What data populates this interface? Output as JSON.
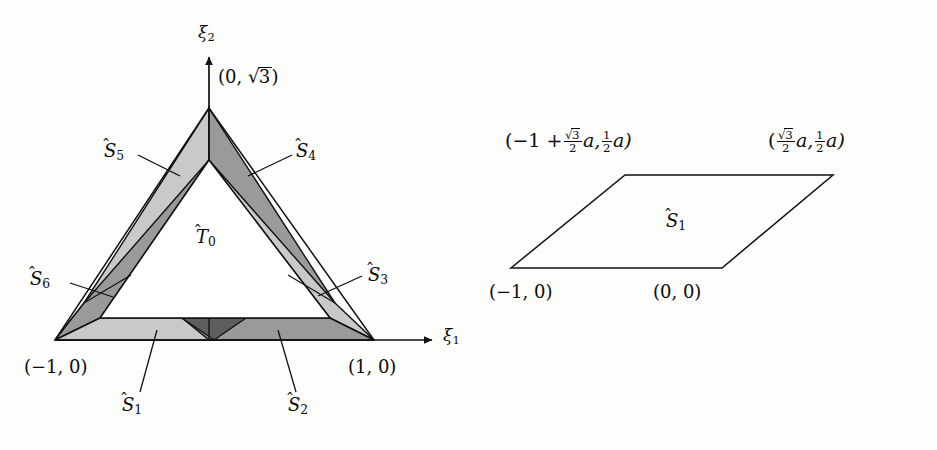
{
  "figure": {
    "colors": {
      "background": "#fdfdfb",
      "stroke": "#111111",
      "light_gray": "#c8c8c8",
      "medium_gray": "#9a9a9a",
      "dark_gray": "#5e5e5e",
      "white": "#ffffff"
    }
  },
  "left_panel": {
    "name": "triangle-with-strips",
    "axes": {
      "x_axis_label": "ξ",
      "x_axis_sub": "1",
      "y_axis_label": "ξ",
      "y_axis_sub": "2"
    },
    "vertices": [
      {
        "name": "apex",
        "label_main": "(0, ",
        "label_sqrt": "3",
        "label_tail": ")",
        "coords": "(0, √3)"
      },
      {
        "name": "bottom-left",
        "label": "(−1, 0)",
        "coords": "(-1,0)"
      },
      {
        "name": "bottom-right",
        "label": "(1, 0)",
        "coords": "(1,0)"
      }
    ],
    "regions": [
      {
        "id": "T0",
        "letter": "T",
        "sub": "0",
        "shade": "white"
      },
      {
        "id": "S1",
        "letter": "S",
        "sub": "1",
        "shade": "light_gray"
      },
      {
        "id": "S2",
        "letter": "S",
        "sub": "2",
        "shade": "medium_gray"
      },
      {
        "id": "S3",
        "letter": "S",
        "sub": "3",
        "shade": "light_gray"
      },
      {
        "id": "S4",
        "letter": "S",
        "sub": "4",
        "shade": "medium_gray"
      },
      {
        "id": "S5",
        "letter": "S",
        "sub": "5",
        "shade": "light_gray"
      },
      {
        "id": "S6",
        "letter": "S",
        "sub": "6",
        "shade": "medium_gray"
      }
    ]
  },
  "right_panel": {
    "name": "parallelogram-detail",
    "region": {
      "letter": "S",
      "sub": "1"
    },
    "corner_labels": {
      "bottom_left": "(−1, 0)",
      "bottom_right": "(0, 0)",
      "top_left_prefix": "(−1 +",
      "top_left_sqrt_num": "3",
      "top_left_den": "2",
      "top_left_var": "a,",
      "top_left_half_num": "1",
      "top_left_half_den": "2",
      "top_left_suffix": "a)",
      "top_right_prefix": "(",
      "top_right_sqrt_num": "3",
      "top_right_den": "2",
      "top_right_var": "a,",
      "top_right_half_num": "1",
      "top_right_half_den": "2",
      "top_right_suffix": "a)"
    }
  }
}
